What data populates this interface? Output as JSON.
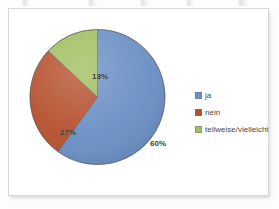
{
  "panel": {
    "background_color": "#FFFFFF",
    "border_color": "#D8D8DA"
  },
  "chart_data": {
    "type": "pie",
    "title": "",
    "subtitle": "",
    "xlabel": "",
    "ylabel": "",
    "grid": false,
    "legend_position": "right",
    "start_angle_deg": 0,
    "direction": "clockwise",
    "categories": [
      "ja",
      "nein",
      "teilweise/vielleicht"
    ],
    "values": [
      60,
      27,
      13
    ],
    "value_unit": "%",
    "data_labels": [
      "60%",
      "27%",
      "13%"
    ],
    "colors": [
      "#6B90C4",
      "#B6512F",
      "#A0BF5E"
    ],
    "slices": [
      {
        "label": "ja",
        "value": 60,
        "data_label": "60%",
        "color": "#6B90C4",
        "start_deg": 0,
        "end_deg": 216
      },
      {
        "label": "nein",
        "value": 27,
        "data_label": "27%",
        "color": "#B6512F",
        "start_deg": 216,
        "end_deg": 313.2
      },
      {
        "label": "teilweise/vielleicht",
        "value": 13,
        "data_label": "13%",
        "color": "#A0BF5E",
        "start_deg": 313.2,
        "end_deg": 360
      }
    ]
  },
  "legend": {
    "items": [
      {
        "label": "ja",
        "color": "#6B90C4"
      },
      {
        "label": "nein",
        "color": "#B6512F"
      },
      {
        "label": "teilweise/vielleicht",
        "color": "#A0BF5E"
      }
    ]
  }
}
